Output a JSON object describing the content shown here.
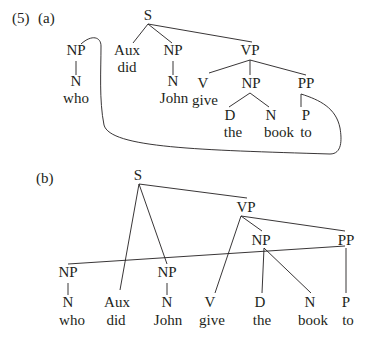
{
  "example": {
    "number": "(5)",
    "parts": [
      {
        "label": "(a)",
        "description": "Constituent tree with a movement arc linking NP 'who' and PP 'to'",
        "nodes": [
          {
            "id": "S",
            "text": "S",
            "x": 148,
            "y": 20
          },
          {
            "id": "NP1",
            "text": "NP",
            "x": 76,
            "y": 55
          },
          {
            "id": "N1",
            "text": "N",
            "x": 76,
            "y": 86
          },
          {
            "id": "w_who",
            "text": "who",
            "x": 76,
            "y": 103
          },
          {
            "id": "Aux",
            "text": "Aux",
            "x": 127,
            "y": 55
          },
          {
            "id": "w_did",
            "text": "did",
            "x": 127,
            "y": 72
          },
          {
            "id": "NP2",
            "text": "NP",
            "x": 173,
            "y": 55
          },
          {
            "id": "N2",
            "text": "N",
            "x": 173,
            "y": 86
          },
          {
            "id": "w_John",
            "text": "John",
            "x": 174,
            "y": 103
          },
          {
            "id": "VP",
            "text": "VP",
            "x": 250,
            "y": 55
          },
          {
            "id": "V",
            "text": "V",
            "x": 203,
            "y": 88
          },
          {
            "id": "w_give",
            "text": "give",
            "x": 205,
            "y": 105
          },
          {
            "id": "NP3",
            "text": "NP",
            "x": 251,
            "y": 88
          },
          {
            "id": "D",
            "text": "D",
            "x": 230,
            "y": 120
          },
          {
            "id": "w_the",
            "text": "the",
            "x": 233,
            "y": 137
          },
          {
            "id": "N3",
            "text": "N",
            "x": 271,
            "y": 120
          },
          {
            "id": "w_book",
            "text": "book",
            "x": 279,
            "y": 137
          },
          {
            "id": "PP",
            "text": "PP",
            "x": 306,
            "y": 88
          },
          {
            "id": "P",
            "text": "P",
            "x": 306,
            "y": 120
          },
          {
            "id": "w_to",
            "text": "to",
            "x": 306,
            "y": 137
          }
        ],
        "edges": [
          {
            "x1": 148,
            "y1": 24,
            "x2": 133,
            "y2": 43
          },
          {
            "x1": 148,
            "y1": 24,
            "x2": 172,
            "y2": 43
          },
          {
            "x1": 148,
            "y1": 24,
            "x2": 252,
            "y2": 42
          },
          {
            "x1": 76,
            "y1": 61,
            "x2": 76,
            "y2": 75
          },
          {
            "x1": 173,
            "y1": 61,
            "x2": 173,
            "y2": 75
          },
          {
            "x1": 250,
            "y1": 60,
            "x2": 209,
            "y2": 73
          },
          {
            "x1": 250,
            "y1": 60,
            "x2": 250,
            "y2": 75
          },
          {
            "x1": 250,
            "y1": 60,
            "x2": 306,
            "y2": 75
          },
          {
            "x1": 250,
            "y1": 93,
            "x2": 229,
            "y2": 107
          },
          {
            "x1": 250,
            "y1": 93,
            "x2": 269,
            "y2": 107
          },
          {
            "x1": 301,
            "y1": 94,
            "x2": 301,
            "y2": 107
          }
        ],
        "arc_path": "M 81 44 C 92 34, 101 37, 101 46 C 101 70, 99 100, 104 125 C 110 148, 200 150, 330 154 C 342 154, 342 140, 340 128 C 336 108, 320 100, 301 94"
      },
      {
        "label": "(b)",
        "description": "Discontinuous tree with crossing branches; NP 'who' attached under PP",
        "nodes": [
          {
            "id": "S",
            "text": "S",
            "x": 138,
            "y": 180
          },
          {
            "id": "VP",
            "text": "VP",
            "x": 246,
            "y": 212
          },
          {
            "id": "NP3",
            "text": "NP",
            "x": 261,
            "y": 245
          },
          {
            "id": "PP",
            "text": "PP",
            "x": 346,
            "y": 245
          },
          {
            "id": "NP1",
            "text": "NP",
            "x": 68,
            "y": 277
          },
          {
            "id": "N1",
            "text": "N",
            "x": 68,
            "y": 307
          },
          {
            "id": "w_who",
            "text": "who",
            "x": 72,
            "y": 325
          },
          {
            "id": "Aux",
            "text": "Aux",
            "x": 117,
            "y": 307
          },
          {
            "id": "w_did",
            "text": "did",
            "x": 116,
            "y": 325
          },
          {
            "id": "NP2",
            "text": "NP",
            "x": 167,
            "y": 277
          },
          {
            "id": "N2",
            "text": "N",
            "x": 167,
            "y": 307
          },
          {
            "id": "w_John",
            "text": "John",
            "x": 168,
            "y": 325
          },
          {
            "id": "V",
            "text": "V",
            "x": 210,
            "y": 307
          },
          {
            "id": "w_give",
            "text": "give",
            "x": 212,
            "y": 325
          },
          {
            "id": "D",
            "text": "D",
            "x": 260,
            "y": 307
          },
          {
            "id": "w_the",
            "text": "the",
            "x": 262,
            "y": 325
          },
          {
            "id": "N3",
            "text": "N",
            "x": 310,
            "y": 307
          },
          {
            "id": "w_book",
            "text": "book",
            "x": 313,
            "y": 325
          },
          {
            "id": "P",
            "text": "P",
            "x": 346,
            "y": 307
          },
          {
            "id": "w_to",
            "text": "to",
            "x": 348,
            "y": 325
          }
        ],
        "edges": [
          {
            "x1": 139,
            "y1": 184,
            "x2": 247,
            "y2": 198
          },
          {
            "x1": 139,
            "y1": 184,
            "x2": 120,
            "y2": 290
          },
          {
            "x1": 139,
            "y1": 184,
            "x2": 167,
            "y2": 264
          },
          {
            "x1": 68,
            "y1": 264,
            "x2": 345,
            "y2": 246
          },
          {
            "x1": 68,
            "y1": 283,
            "x2": 68,
            "y2": 295
          },
          {
            "x1": 167,
            "y1": 283,
            "x2": 167,
            "y2": 295
          },
          {
            "x1": 241,
            "y1": 216,
            "x2": 215,
            "y2": 293
          },
          {
            "x1": 241,
            "y1": 216,
            "x2": 262,
            "y2": 231
          },
          {
            "x1": 241,
            "y1": 216,
            "x2": 345,
            "y2": 231
          },
          {
            "x1": 264,
            "y1": 248,
            "x2": 262,
            "y2": 293
          },
          {
            "x1": 264,
            "y1": 248,
            "x2": 311,
            "y2": 293
          },
          {
            "x1": 346,
            "y1": 248,
            "x2": 346,
            "y2": 293
          }
        ]
      }
    ]
  }
}
